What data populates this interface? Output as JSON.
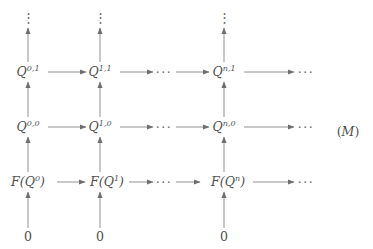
{
  "figure": {
    "kind": "commutative-diagram",
    "tag": "(M)",
    "tag_letter": "M",
    "background_color": "#ffffff",
    "ink_color": "#4f4f4f",
    "arrow_color": "#868686"
  },
  "columns": [
    {
      "key": "c0",
      "index": "0",
      "x": 28
    },
    {
      "key": "c1",
      "index": "1",
      "x": 100
    },
    {
      "key": "cdots",
      "index": "dots",
      "x": 164
    },
    {
      "key": "cn",
      "index": "n",
      "x": 224
    },
    {
      "key": "ctail",
      "index": "tail",
      "x": 306
    }
  ],
  "rows": [
    {
      "key": "r_top_dots",
      "y": 18
    },
    {
      "key": "r_q1",
      "y": 72
    },
    {
      "key": "r_q0",
      "y": 127
    },
    {
      "key": "r_fq",
      "y": 182
    },
    {
      "key": "r_zero",
      "y": 237
    }
  ],
  "nodes": {
    "top_dots": {
      "label": "⋮"
    },
    "row_q1": {
      "col0": {
        "base": "Q",
        "sup": "0,1"
      },
      "col1": {
        "base": "Q",
        "sup": "1,1"
      },
      "mid_dots": "···",
      "coln": {
        "base": "Q",
        "sup": "n,1"
      },
      "tail_dots": "···"
    },
    "row_q0": {
      "col0": {
        "base": "Q",
        "sup": "0,0"
      },
      "col1": {
        "base": "Q",
        "sup": "1,0"
      },
      "mid_dots": "···",
      "coln": {
        "base": "Q",
        "sup": "n,0"
      },
      "tail_dots": "···"
    },
    "row_fq": {
      "col0": {
        "prefix": "F(",
        "base": "Q",
        "sup": "0",
        "suffix": ")"
      },
      "col1": {
        "prefix": "F(",
        "base": "Q",
        "sup": "1",
        "suffix": ")"
      },
      "mid_dots": "···",
      "coln": {
        "prefix": "F(",
        "base": "Q",
        "sup": "n",
        "suffix": ")"
      },
      "tail_dots": "···"
    },
    "row_zero": {
      "col0": "0",
      "col1": "0",
      "coln": "0"
    }
  },
  "arrows": {
    "vertical_direction": "up",
    "horizontal_direction": "right",
    "vertical_count": 12,
    "horizontal_count": 12
  }
}
